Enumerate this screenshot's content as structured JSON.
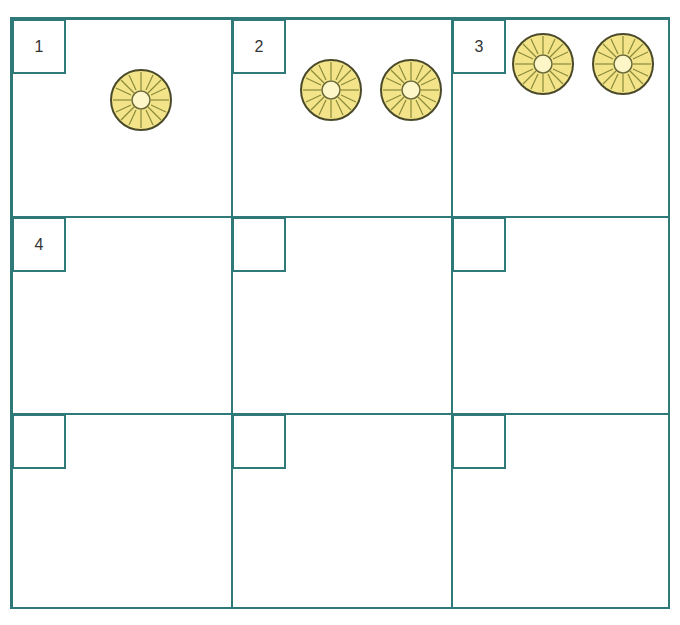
{
  "worksheet": {
    "line_color": "#2f7a78",
    "ring_fill": "#f3e48a",
    "ring_stroke": "#4a4a2a",
    "cells": [
      {
        "label": "1",
        "rings": 1
      },
      {
        "label": "2",
        "rings": 2
      },
      {
        "label": "3",
        "rings": 2
      },
      {
        "label": "4",
        "rings": 0
      },
      {
        "label": "",
        "rings": 0
      },
      {
        "label": "",
        "rings": 0
      },
      {
        "label": "",
        "rings": 0
      },
      {
        "label": "",
        "rings": 0
      },
      {
        "label": "",
        "rings": 0
      }
    ]
  }
}
